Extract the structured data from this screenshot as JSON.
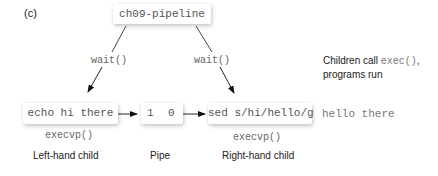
{
  "panel_label": "(c)",
  "parent": {
    "name": "ch09-pipeline"
  },
  "edges": {
    "left_wait": "wait()",
    "right_wait": "wait()"
  },
  "note": {
    "prefix": "Children call",
    "code": "exec()",
    "suffix": ",",
    "line2": "programs run"
  },
  "left_child": {
    "command": "echo hi there",
    "call": "execvp()",
    "caption": "Left-hand child"
  },
  "pipe": {
    "write_end": "1",
    "read_end": "0",
    "caption": "Pipe"
  },
  "right_child": {
    "command": "sed s/hi/hello/g",
    "call": "execvp()",
    "caption": "Right-hand child"
  },
  "output": "hello there"
}
